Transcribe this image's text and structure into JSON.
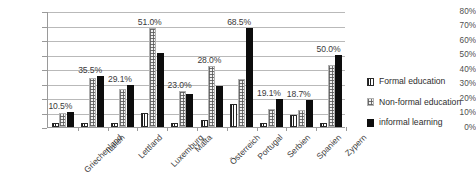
{
  "chart_data": {
    "type": "bar",
    "title": "",
    "subtitle": "",
    "xlabel": "",
    "ylabel": "",
    "ylim": [
      0,
      80
    ],
    "ytick_labels": [
      "80%",
      "70%",
      "60%",
      "50%",
      "40%",
      "30%",
      "20%",
      "10%",
      "0%"
    ],
    "ytick_values": [
      80,
      70,
      60,
      50,
      40,
      30,
      20,
      10,
      0
    ],
    "grid": "horizontal",
    "legend_position": "right",
    "categories": [
      "Griechenland",
      "Italien",
      "Lettland",
      "Luxemburg",
      "Malta",
      "Österreich",
      "Portugal",
      "Serbien",
      "Spanien",
      "Zypern"
    ],
    "series": [
      {
        "name": "Formal education",
        "style": "vertical-stripes",
        "values": [
          2.5,
          2.5,
          3.0,
          10.0,
          3.0,
          4.5,
          16.0,
          2.5,
          8.0,
          2.5
        ]
      },
      {
        "name": "Non-formal education",
        "style": "dotted-texture",
        "values": [
          9.5,
          34.0,
          26.0,
          68.0,
          24.5,
          42.0,
          33.0,
          12.5,
          11.5,
          43.0
        ]
      },
      {
        "name": "informal learning",
        "style": "solid-black",
        "values": [
          10.5,
          35.5,
          29.1,
          51.0,
          23.0,
          28.0,
          68.5,
          19.1,
          18.7,
          50.0
        ]
      }
    ],
    "data_labels": [
      "10.5%",
      "35.5%",
      "29.1%",
      "51.0%",
      "23.0%",
      "28.0%",
      "68.5%",
      "19.1%",
      "18.7%",
      "50.0%"
    ]
  },
  "legend": {
    "items": [
      {
        "label": "Formal education"
      },
      {
        "label": "Non-formal education"
      },
      {
        "label": "informal learning"
      }
    ]
  },
  "colors": {
    "informal": "#0d0d0d",
    "nonformal": "#f2f2f2",
    "formal": "#ffffff",
    "grid": "#b9b9b9",
    "axis": "#9a9a9a",
    "text": "#3a3a3a"
  }
}
